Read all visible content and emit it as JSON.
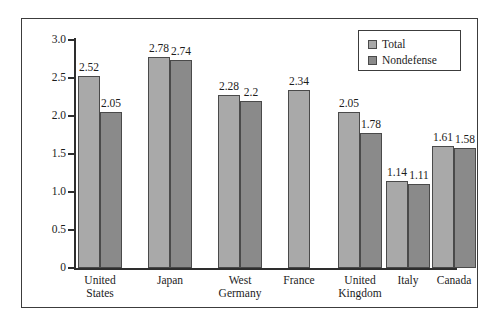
{
  "chart_data": {
    "type": "bar",
    "title": "",
    "xlabel": "",
    "ylabel": "Percent",
    "ylim": [
      0,
      3.0
    ],
    "ytick_labels": [
      "0",
      "0.5",
      "1.0",
      "1.5",
      "2.0",
      "2.5",
      "3.0"
    ],
    "ytick_values": [
      0,
      0.5,
      1.0,
      1.5,
      2.0,
      2.5,
      3.0
    ],
    "grid": false,
    "legend_position": "top-right",
    "categories": [
      "United\nStates",
      "Japan",
      "West\nGermany",
      "France",
      "United\nKingdom",
      "Italy",
      "Canada"
    ],
    "series": [
      {
        "name": "Total",
        "color": "#a9a9a9",
        "values": [
          2.52,
          2.78,
          2.28,
          2.34,
          2.05,
          1.14,
          1.61
        ],
        "labels": [
          "2.52",
          "2.78",
          "2.28",
          "2.34",
          "2.05",
          "1.14",
          "1.61"
        ]
      },
      {
        "name": "Nondefense",
        "color": "#8a8a8a",
        "values": [
          2.05,
          2.74,
          2.2,
          null,
          1.78,
          1.11,
          1.58
        ],
        "labels": [
          "2.05",
          "2.74",
          "2.2",
          "",
          "1.78",
          "1.11",
          "1.58"
        ]
      }
    ]
  },
  "legend": {
    "entries": [
      {
        "label": "Total",
        "swatch": "total-swatch"
      },
      {
        "label": "Nondefense",
        "swatch": "nondefense-swatch"
      }
    ]
  },
  "axis": {
    "y_label": "Percent",
    "ticks": [
      {
        "label": "3.0",
        "value": 3.0
      },
      {
        "label": "2.5",
        "value": 2.5
      },
      {
        "label": "2.0",
        "value": 2.0
      },
      {
        "label": "1.5",
        "value": 1.5
      },
      {
        "label": "1.0",
        "value": 1.0
      },
      {
        "label": "0.5",
        "value": 0.5
      },
      {
        "label": "0",
        "value": 0
      }
    ]
  }
}
